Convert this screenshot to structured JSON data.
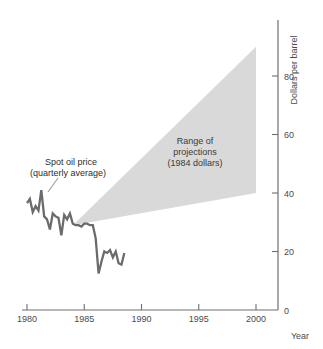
{
  "chart_data": {
    "type": "line",
    "title": "",
    "xlabel": "Year",
    "ylabel": "Dollars per barrel",
    "xlim": [
      1979.2,
      2001.2
    ],
    "ylim": [
      0,
      99
    ],
    "grid": false,
    "legend_position": "none",
    "x_ticks": [
      "1980",
      "1985",
      "1990",
      "1995",
      "2000"
    ],
    "x_tick_values": [
      1980,
      1985,
      1990,
      1995,
      2000
    ],
    "y_ticks": [
      "0",
      "20",
      "40",
      "60",
      "80"
    ],
    "y_tick_values": [
      0,
      20,
      40,
      60,
      80
    ],
    "series": [
      {
        "name": "Spot oil price (quarterly average)",
        "type": "line",
        "color": "#6b6b6b",
        "x": [
          1980.0,
          1980.25,
          1980.5,
          1980.75,
          1981.0,
          1981.25,
          1981.5,
          1981.75,
          1982.0,
          1982.25,
          1982.5,
          1982.75,
          1983.0,
          1983.25,
          1983.5,
          1983.75,
          1984.0,
          1984.25,
          1984.5,
          1984.75,
          1985.0,
          1985.25,
          1985.5,
          1985.75,
          1986.0,
          1986.25,
          1986.5,
          1986.75,
          1987.0,
          1987.25,
          1987.5,
          1987.75,
          1988.0,
          1988.25,
          1988.5
        ],
        "y": [
          36.5,
          38.0,
          33.5,
          35.5,
          34.0,
          41.0,
          32.0,
          31.0,
          27.5,
          33.0,
          32.0,
          31.5,
          25.5,
          32.5,
          31.0,
          33.0,
          29.5,
          29.0,
          29.0,
          28.5,
          29.5,
          29.5,
          29.0,
          29.0,
          24.5,
          12.5,
          16.5,
          20.0,
          19.5,
          20.5,
          18.0,
          20.0,
          16.0,
          15.5,
          19.5
        ]
      }
    ],
    "bands": [
      {
        "name": "Range of projections (1984 dollars)",
        "color": "#d9d9d9",
        "apex": {
          "x": 1984.0,
          "y": 29.0
        },
        "end_x": 2000,
        "end_low": 40,
        "end_high": 90
      }
    ],
    "annotations": [
      {
        "name": "spot-oil-price-label",
        "line1": "Spot oil price",
        "line2": "(quarterly average)",
        "x": 1980.6,
        "y": 56,
        "leader_to": {
          "x": 1981.35,
          "y": 42
        }
      },
      {
        "name": "range-of-projections-label",
        "line1": "Range of",
        "line2": "projections",
        "line3": "(1984 dollars)",
        "x": 1993.4,
        "y": 50
      }
    ]
  }
}
